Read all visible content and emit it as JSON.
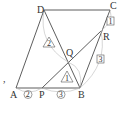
{
  "diagram": {
    "type": "parallelogram geometry figure",
    "points": {
      "A": {
        "label": "A",
        "x": 16,
        "y": 88
      },
      "B": {
        "label": "B",
        "x": 80,
        "y": 88
      },
      "C": {
        "label": "C",
        "x": 110,
        "y": 10
      },
      "D": {
        "label": "D",
        "x": 44,
        "y": 10
      },
      "P": {
        "label": "P",
        "x": 42,
        "y": 88
      },
      "Q": {
        "label": "Q",
        "x": 68,
        "y": 62
      },
      "R": {
        "label": "R",
        "x": 101,
        "y": 31
      }
    },
    "ratio_marks": {
      "AP": "2",
      "PB": "3",
      "CR": "1",
      "RB": "3",
      "DQ": "2",
      "QB": "1"
    },
    "stray_mark": ","
  }
}
